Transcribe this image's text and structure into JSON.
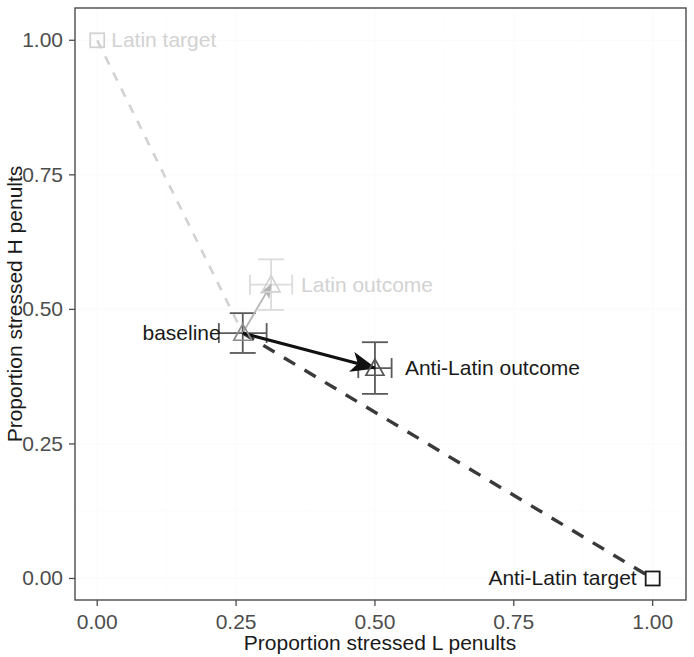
{
  "chart_data": {
    "type": "scatter",
    "title": "",
    "xlabel": "Proportion stressed L penults",
    "ylabel": "Proportion stressed H penults",
    "xlim": [
      -0.04,
      1.06
    ],
    "ylim": [
      -0.04,
      1.06
    ],
    "xticks": [
      "0.00",
      "0.25",
      "0.50",
      "0.75",
      "1.00"
    ],
    "xtick_values": [
      0.0,
      0.25,
      0.5,
      0.75,
      1.0
    ],
    "yticks": [
      "0.00",
      "0.25",
      "0.50",
      "0.75",
      "1.00"
    ],
    "ytick_values": [
      0.0,
      0.25,
      0.5,
      0.75,
      1.0
    ],
    "grid": true,
    "legend": "none",
    "points": [
      {
        "name": "latin-target",
        "label": "Latin target",
        "x": 0.0,
        "y": 1.0,
        "marker": "square",
        "color": "#d2d2d2",
        "label_anchor": "start",
        "label_dx": 14,
        "label_dy": 7
      },
      {
        "name": "anti-latin-target",
        "label": "Anti-Latin target",
        "x": 1.0,
        "y": 0.0,
        "marker": "square",
        "color": "#1a1a1a",
        "label_anchor": "end",
        "label_dx": -16,
        "label_dy": 7
      },
      {
        "name": "baseline",
        "label": "baseline",
        "x": 0.262,
        "y": 0.456,
        "marker": "triangle",
        "color": "#8c8c8c",
        "xerr": 0.043,
        "yerr": 0.037,
        "label_anchor": "end",
        "label_dx": -22,
        "label_dy": 7
      },
      {
        "name": "latin-outcome",
        "label": "Latin outcome",
        "x": 0.313,
        "y": 0.546,
        "marker": "triangle",
        "color": "#d2d2d2",
        "xerr": 0.038,
        "yerr": 0.047,
        "label_anchor": "start",
        "label_dx": 30,
        "label_dy": 7
      },
      {
        "name": "anti-latin-outcome",
        "label": "Anti-Latin outcome",
        "x": 0.5,
        "y": 0.391,
        "marker": "triangle",
        "color": "#555555",
        "xerr": 0.03,
        "yerr": 0.048,
        "label_anchor": "start",
        "label_dx": 30,
        "label_dy": 7
      }
    ],
    "reference_lines": [
      {
        "name": "latin-reference",
        "from": [
          0.0,
          1.0
        ],
        "to": [
          0.262,
          0.456
        ],
        "style": "dashed",
        "color": "#d2d2d2"
      },
      {
        "name": "anti-latin-reference",
        "from": [
          0.262,
          0.456
        ],
        "to": [
          1.0,
          0.0
        ],
        "style": "dashed",
        "color": "#3a3a3a"
      }
    ],
    "arrows": [
      {
        "name": "baseline-to-latin-outcome",
        "from": [
          0.262,
          0.456
        ],
        "to": [
          0.313,
          0.546
        ],
        "color": "#b4b4b4"
      },
      {
        "name": "baseline-to-anti-latin-outcome",
        "from": [
          0.262,
          0.456
        ],
        "to": [
          0.5,
          0.391
        ],
        "color": "#111111"
      }
    ]
  }
}
